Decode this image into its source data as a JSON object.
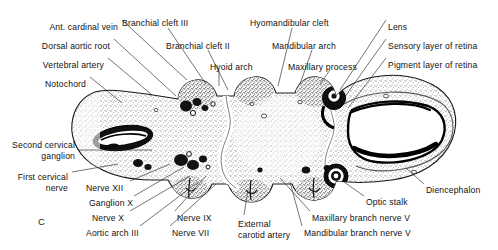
{
  "figure": {
    "letter": "C",
    "background_color": "#ffffff",
    "ink_color": "#111111"
  },
  "labels": {
    "top_left": [
      {
        "id": "ant-cardinal-vein",
        "text": "Ant. cardinal vein",
        "x": 118,
        "y": 22,
        "align": "right"
      },
      {
        "id": "dorsal-aortic-root",
        "text": "Dorsal aortic root",
        "x": 110,
        "y": 41,
        "align": "right"
      },
      {
        "id": "vertebral-artery",
        "text": "Vertebral artery",
        "x": 104,
        "y": 60,
        "align": "right"
      },
      {
        "id": "notochord",
        "text": "Notochord",
        "x": 86,
        "y": 79,
        "align": "right"
      }
    ],
    "top_middle": [
      {
        "id": "branchial-cleft-iii",
        "text": "Branchial cleft III",
        "x": 122,
        "y": 18,
        "align": "left"
      },
      {
        "id": "branchial-cleft-ii",
        "text": "Branchial cleft II",
        "x": 166,
        "y": 41,
        "align": "left"
      },
      {
        "id": "hyoid-arch",
        "text": "Hyoid arch",
        "x": 210,
        "y": 62,
        "align": "left"
      },
      {
        "id": "hyomandibular-cleft",
        "text": "Hyomandibular cleft",
        "x": 250,
        "y": 18,
        "align": "left"
      },
      {
        "id": "mandibular-arch",
        "text": "Mandibular arch",
        "x": 272,
        "y": 41,
        "align": "left"
      },
      {
        "id": "maxillary-process",
        "text": "Maxillary process",
        "x": 288,
        "y": 62,
        "align": "left"
      }
    ],
    "top_right": [
      {
        "id": "lens",
        "text": "Lens",
        "x": 388,
        "y": 22,
        "align": "left"
      },
      {
        "id": "sensory-layer-of-retina",
        "text": "Sensory layer of retina",
        "x": 388,
        "y": 41,
        "align": "left"
      },
      {
        "id": "pigment-layer-of-retina",
        "text": "Pigment layer of retina",
        "x": 388,
        "y": 60,
        "align": "left"
      }
    ],
    "left": [
      {
        "id": "second-cervical-ganglion",
        "line1": "Second cervical",
        "line2": "ganglion",
        "x": 75,
        "y": 140,
        "align": "right"
      },
      {
        "id": "first-cervical-nerve",
        "line1": "First cervical",
        "line2": "nerve",
        "x": 68,
        "y": 172,
        "align": "right"
      }
    ],
    "bottom": [
      {
        "id": "nerve-xii",
        "text": "Nerve XII",
        "x": 86,
        "y": 183,
        "align": "left"
      },
      {
        "id": "ganglion-x",
        "text": "Ganglion X",
        "x": 89,
        "y": 198,
        "align": "left"
      },
      {
        "id": "nerve-x",
        "text": "Nerve X",
        "x": 92,
        "y": 213,
        "align": "left"
      },
      {
        "id": "aortic-arch-iii",
        "text": "Aortic arch III",
        "x": 86,
        "y": 228,
        "align": "left"
      },
      {
        "id": "nerve-ix",
        "text": "Nerve IX",
        "x": 177,
        "y": 213,
        "align": "left"
      },
      {
        "id": "nerve-vii",
        "text": "Nerve VII",
        "x": 172,
        "y": 228,
        "align": "left"
      },
      {
        "id": "external-carotid-artery",
        "line1": "External",
        "line2": "carotid artery",
        "x": 238,
        "y": 219,
        "align": "left"
      },
      {
        "id": "maxillary-branch-nerve-v",
        "text": "Maxillary branch nerve V",
        "x": 312,
        "y": 213,
        "align": "left"
      },
      {
        "id": "mandibular-branch-nerve-v",
        "text": "Mandibular branch nerve V",
        "x": 304,
        "y": 228,
        "align": "left"
      },
      {
        "id": "optic-stalk",
        "text": "Optic stalk",
        "x": 366,
        "y": 197,
        "align": "left"
      }
    ],
    "right": [
      {
        "id": "diencephalon",
        "text": "Diencephalon",
        "x": 426,
        "y": 185,
        "align": "left"
      }
    ]
  }
}
